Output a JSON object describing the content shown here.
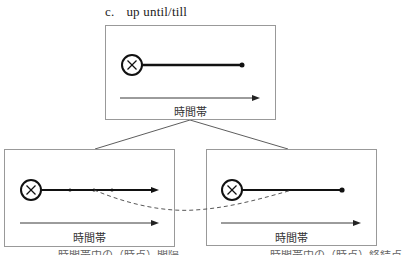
{
  "title": {
    "label": "c.",
    "text": "up until/till"
  },
  "panels": {
    "top": {
      "axis_label": "時間帯"
    },
    "left": {
      "axis_label": "時間帯",
      "caption": "時間帯中の（時点）間隔"
    },
    "right": {
      "axis_label": "時間帯",
      "caption": "時間帯中の（時点）終結点"
    }
  },
  "icons": {
    "event_marker": "circled-x-icon"
  },
  "colors": {
    "stroke": "#111111",
    "box_border": "#999999",
    "dashed": "#444444"
  }
}
